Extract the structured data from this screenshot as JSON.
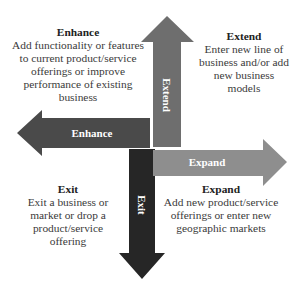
{
  "diagram": {
    "type": "four-direction growth strategy arrows",
    "arrows": [
      {
        "id": "extend",
        "label": "Extend",
        "direction": "up",
        "color": "#6e6e6e"
      },
      {
        "id": "enhance",
        "label": "Enhance",
        "direction": "left",
        "color": "#4a4a4a"
      },
      {
        "id": "expand",
        "label": "Expand",
        "direction": "right",
        "color": "#8e8e8e"
      },
      {
        "id": "exit",
        "label": "Exit",
        "direction": "down",
        "color": "#262626"
      }
    ],
    "quadrants": {
      "enhance": {
        "title": "Enhance",
        "lines": [
          "Add functionality or features",
          "to current product/service",
          "offerings or improve",
          "performance of existing",
          "business"
        ]
      },
      "extend": {
        "title": "Extend",
        "lines": [
          "Enter new line of",
          "business and/or add",
          "new business",
          "models"
        ]
      },
      "exit": {
        "title": "Exit",
        "lines": [
          "Exit a business or",
          "market or drop a",
          "product/service",
          "offering"
        ]
      },
      "expand": {
        "title": "Expand",
        "lines": [
          "Add new product/service",
          "offerings or enter new",
          "geographic markets"
        ]
      }
    }
  }
}
